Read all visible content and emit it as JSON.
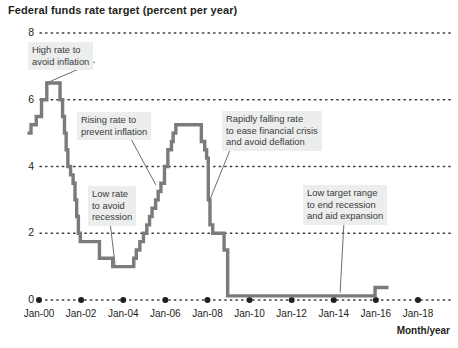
{
  "chart_data": {
    "type": "line",
    "title": "Federal funds rate target (percent per year)",
    "xlabel": "Month/year",
    "ylabel": "",
    "ylim": [
      0,
      8
    ],
    "xlim": [
      1999.0,
      2018.6
    ],
    "yticks": [
      "0",
      "2",
      "4",
      "6",
      "8"
    ],
    "ytick_values": [
      0,
      2,
      4,
      6,
      8
    ],
    "xticks": [
      "Jan-00",
      "Jan-02",
      "Jan-04",
      "Jan-06",
      "Jan-08",
      "Jan-10",
      "Jan-12",
      "Jan-14",
      "Jan-16",
      "Jan-18"
    ],
    "xtick_values": [
      2000,
      2002,
      2004,
      2006,
      2008,
      2010,
      2012,
      2014,
      2016,
      2018
    ],
    "grid": "horizontal-dotted",
    "legend": "none",
    "line_color": "#7b7b7b",
    "series": [
      {
        "name": "Federal funds rate target",
        "step": "post",
        "points": [
          [
            1999.45,
            5.0
          ],
          [
            1999.62,
            5.25
          ],
          [
            1999.87,
            5.5
          ],
          [
            2000.12,
            6.0
          ],
          [
            2000.37,
            6.5
          ],
          [
            2001.0,
            6.0
          ],
          [
            2001.12,
            5.5
          ],
          [
            2001.21,
            5.0
          ],
          [
            2001.29,
            4.5
          ],
          [
            2001.37,
            4.0
          ],
          [
            2001.5,
            3.75
          ],
          [
            2001.62,
            3.5
          ],
          [
            2001.71,
            3.0
          ],
          [
            2001.79,
            2.5
          ],
          [
            2001.87,
            2.0
          ],
          [
            2001.96,
            1.75
          ],
          [
            2002.87,
            1.25
          ],
          [
            2003.5,
            1.0
          ],
          [
            2004.5,
            1.25
          ],
          [
            2004.62,
            1.5
          ],
          [
            2004.79,
            1.75
          ],
          [
            2004.96,
            2.0
          ],
          [
            2005.12,
            2.25
          ],
          [
            2005.25,
            2.5
          ],
          [
            2005.37,
            2.75
          ],
          [
            2005.54,
            3.0
          ],
          [
            2005.66,
            3.25
          ],
          [
            2005.79,
            3.5
          ],
          [
            2005.96,
            4.0
          ],
          [
            2006.12,
            4.5
          ],
          [
            2006.29,
            4.75
          ],
          [
            2006.37,
            5.0
          ],
          [
            2006.5,
            5.25
          ],
          [
            2007.71,
            4.75
          ],
          [
            2007.87,
            4.5
          ],
          [
            2007.96,
            4.25
          ],
          [
            2008.04,
            3.0
          ],
          [
            2008.12,
            2.25
          ],
          [
            2008.25,
            2.0
          ],
          [
            2008.79,
            1.5
          ],
          [
            2008.96,
            0.125
          ],
          [
            2015.96,
            0.375
          ],
          [
            2016.6,
            0.375
          ]
        ]
      }
    ],
    "annotations": [
      {
        "id": "high-rate",
        "text": "High rate to\navoid inflation",
        "target": [
          2000.3,
          6.5
        ]
      },
      {
        "id": "rising-rate",
        "text": "Rising rate to\nprevent inflation",
        "target": [
          2005.6,
          3.4
        ]
      },
      {
        "id": "low-rate",
        "text": "Low rate\nto avoid\nrecession",
        "target": [
          2003.6,
          1.0
        ]
      },
      {
        "id": "rapidly-falling-rate",
        "text": "Rapidly falling rate\nto ease financial crisis\nand avoid deflation",
        "target": [
          2008.1,
          2.9
        ]
      },
      {
        "id": "low-target-range",
        "text": "Low target range\nto end recession\nand aid expansion",
        "target": [
          2014.3,
          0.125
        ]
      }
    ]
  },
  "axis_caption": "Month/year"
}
